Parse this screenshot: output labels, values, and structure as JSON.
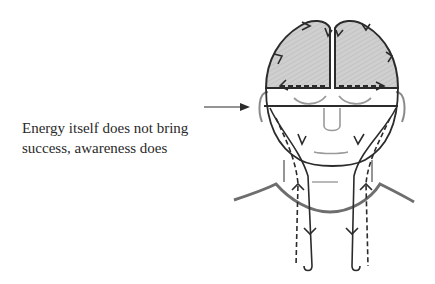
{
  "diagram": {
    "type": "anatomical-illustration",
    "annotation": {
      "line1": "Energy itself does not bring",
      "line2": "success, awareness does",
      "pointer": "arrow pointing right to horizontal line at eye level"
    },
    "colors": {
      "outline": "#2b2b2b",
      "brain_fill": "#c8c8c8",
      "face_features": "#9a9a9a",
      "shoulder_line": "#6e6e6e",
      "text": "#2a2a2a"
    },
    "regions": [
      {
        "name": "left-brain-hemisphere",
        "shaded": true,
        "arrows": "solid outline with arrowheads circulating"
      },
      {
        "name": "right-brain-hemisphere",
        "shaded": true,
        "arrows": "solid outline with arrowheads circulating"
      },
      {
        "name": "eye-level-line",
        "style": "solid horizontal"
      },
      {
        "name": "left-neck-channels",
        "style": "solid downward and dashed upward flow"
      },
      {
        "name": "right-neck-channels",
        "style": "solid downward and dashed upward flow"
      }
    ]
  }
}
